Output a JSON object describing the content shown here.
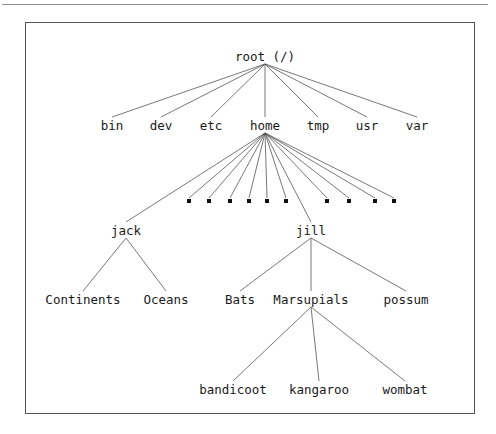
{
  "figure": {
    "title": "",
    "background_color": "#ffffff",
    "frame_color": "#555555",
    "line_color": "#555555",
    "text_color": "#1a1a1a",
    "marker_color": "#111111"
  },
  "chart_data": {
    "type": "diagram",
    "diagram_kind": "tree",
    "title": "",
    "orientation": "top-down",
    "nodes": [
      {
        "id": "root",
        "label": "root (/)",
        "x": 265,
        "y": 57,
        "level": 0,
        "kind": "label"
      },
      {
        "id": "bin",
        "label": "bin",
        "x": 112,
        "y": 126,
        "level": 1,
        "kind": "label"
      },
      {
        "id": "dev",
        "label": "dev",
        "x": 161,
        "y": 126,
        "level": 1,
        "kind": "label"
      },
      {
        "id": "etc",
        "label": "etc",
        "x": 211,
        "y": 126,
        "level": 1,
        "kind": "label"
      },
      {
        "id": "home",
        "label": "home",
        "x": 265,
        "y": 126,
        "level": 1,
        "kind": "label"
      },
      {
        "id": "tmp",
        "label": "tmp",
        "x": 318,
        "y": 126,
        "level": 1,
        "kind": "label"
      },
      {
        "id": "usr",
        "label": "usr",
        "x": 367,
        "y": 126,
        "level": 1,
        "kind": "label"
      },
      {
        "id": "var",
        "label": "var",
        "x": 417,
        "y": 126,
        "level": 1,
        "kind": "label"
      },
      {
        "id": "home-leaf-1",
        "label": "",
        "x": 189,
        "y": 201,
        "level": 2,
        "kind": "marker"
      },
      {
        "id": "home-leaf-2",
        "label": "",
        "x": 209,
        "y": 201,
        "level": 2,
        "kind": "marker"
      },
      {
        "id": "home-leaf-3",
        "label": "",
        "x": 230,
        "y": 201,
        "level": 2,
        "kind": "marker"
      },
      {
        "id": "home-leaf-4",
        "label": "",
        "x": 249,
        "y": 201,
        "level": 2,
        "kind": "marker"
      },
      {
        "id": "home-leaf-5",
        "label": "",
        "x": 267,
        "y": 201,
        "level": 2,
        "kind": "marker"
      },
      {
        "id": "home-leaf-6",
        "label": "",
        "x": 286,
        "y": 201,
        "level": 2,
        "kind": "marker"
      },
      {
        "id": "home-leaf-7",
        "label": "",
        "x": 327,
        "y": 201,
        "level": 2,
        "kind": "marker"
      },
      {
        "id": "home-leaf-8",
        "label": "",
        "x": 349,
        "y": 201,
        "level": 2,
        "kind": "marker"
      },
      {
        "id": "home-leaf-9",
        "label": "",
        "x": 375,
        "y": 201,
        "level": 2,
        "kind": "marker"
      },
      {
        "id": "home-leaf-10",
        "label": "",
        "x": 394,
        "y": 201,
        "level": 2,
        "kind": "marker"
      },
      {
        "id": "jack",
        "label": "jack",
        "x": 126,
        "y": 231,
        "level": 2,
        "kind": "label"
      },
      {
        "id": "jill",
        "label": "jill",
        "x": 311,
        "y": 231,
        "level": 2,
        "kind": "label"
      },
      {
        "id": "continents",
        "label": "Continents",
        "x": 83,
        "y": 300,
        "level": 3,
        "kind": "label"
      },
      {
        "id": "oceans",
        "label": "Oceans",
        "x": 166,
        "y": 300,
        "level": 3,
        "kind": "label"
      },
      {
        "id": "bats",
        "label": "Bats",
        "x": 240,
        "y": 300,
        "level": 3,
        "kind": "label"
      },
      {
        "id": "marsupials",
        "label": "Marsupials",
        "x": 311,
        "y": 300,
        "level": 3,
        "kind": "label"
      },
      {
        "id": "possum",
        "label": "possum",
        "x": 406,
        "y": 300,
        "level": 3,
        "kind": "label"
      },
      {
        "id": "bandicoot",
        "label": "bandicoot",
        "x": 233,
        "y": 390,
        "level": 4,
        "kind": "label"
      },
      {
        "id": "kangaroo",
        "label": "kangaroo",
        "x": 319,
        "y": 390,
        "level": 4,
        "kind": "label"
      },
      {
        "id": "wombat",
        "label": "wombat",
        "x": 405,
        "y": 390,
        "level": 4,
        "kind": "label"
      }
    ],
    "edges": [
      {
        "from": "root",
        "to": "bin"
      },
      {
        "from": "root",
        "to": "dev"
      },
      {
        "from": "root",
        "to": "etc"
      },
      {
        "from": "root",
        "to": "home"
      },
      {
        "from": "root",
        "to": "tmp"
      },
      {
        "from": "root",
        "to": "usr"
      },
      {
        "from": "root",
        "to": "var"
      },
      {
        "from": "home",
        "to": "jack"
      },
      {
        "from": "home",
        "to": "home-leaf-1"
      },
      {
        "from": "home",
        "to": "home-leaf-2"
      },
      {
        "from": "home",
        "to": "home-leaf-3"
      },
      {
        "from": "home",
        "to": "home-leaf-4"
      },
      {
        "from": "home",
        "to": "home-leaf-5"
      },
      {
        "from": "home",
        "to": "home-leaf-6"
      },
      {
        "from": "home",
        "to": "jill"
      },
      {
        "from": "home",
        "to": "home-leaf-7"
      },
      {
        "from": "home",
        "to": "home-leaf-8"
      },
      {
        "from": "home",
        "to": "home-leaf-9"
      },
      {
        "from": "home",
        "to": "home-leaf-10"
      },
      {
        "from": "jack",
        "to": "continents"
      },
      {
        "from": "jack",
        "to": "oceans"
      },
      {
        "from": "jill",
        "to": "bats"
      },
      {
        "from": "jill",
        "to": "marsupials"
      },
      {
        "from": "jill",
        "to": "possum"
      },
      {
        "from": "marsupials",
        "to": "bandicoot"
      },
      {
        "from": "marsupials",
        "to": "kangaroo"
      },
      {
        "from": "marsupials",
        "to": "wombat"
      }
    ],
    "hierarchy_text": "root (/) -> [bin, dev, etc, home, tmp, usr, var]; home -> [jack, jill, 10 unnamed leaf markers]; jack -> [Continents, Oceans]; jill -> [Bats, Marsupials, possum]; Marsupials -> [bandicoot, kangaroo, wombat]"
  }
}
